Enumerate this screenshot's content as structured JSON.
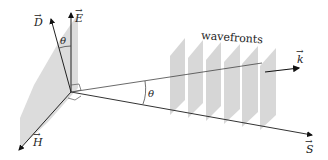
{
  "diagram": {
    "labels": {
      "D": "D",
      "E": "E",
      "H": "H",
      "S": "S",
      "k": "k",
      "theta_top": "θ",
      "theta_mid": "θ",
      "wavefronts": "wavefronts"
    },
    "wavefront_count": 6,
    "colors": {
      "plane_fill": "#d9d9d9",
      "line": "#333333",
      "background": "#ffffff"
    }
  }
}
